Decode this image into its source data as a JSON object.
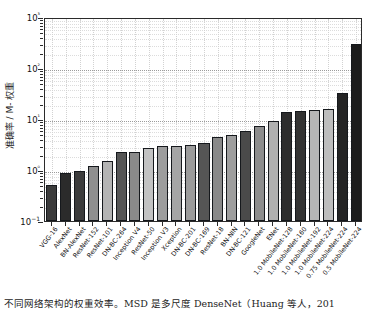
{
  "chart_data": {
    "type": "bar",
    "title": "",
    "xlabel": "",
    "ylabel": "准确率 / M- 权重",
    "yscale": "log",
    "ylim": [
      0.1,
      1000
    ],
    "ytick_labels": [
      "10−1",
      "10⁰",
      "10¹",
      "10²",
      "10³"
    ],
    "ytick_values": [
      0.1,
      1,
      10,
      100,
      1000
    ],
    "grid": true,
    "legend": "none",
    "categories": [
      "VGG-16",
      "AlexNet",
      "BN-AlexNet",
      "ResNet-152",
      "ResNet-101",
      "DN-BC-264",
      "Inception V4",
      "ResNet-50",
      "Inception V3",
      "Xception",
      "DN-BC-201",
      "DN-BC-169",
      "ResNet-18",
      "BN-NIN",
      "DN-BC-121",
      "GoogleNet",
      "ENet",
      "1.0 MobileNet-128",
      "1.0 MobileNet-160",
      "1.0 MobileNet-192",
      "1.0 MobileNet-224",
      "0.75 MobileNet-224",
      "0.5 MobileNet-224"
    ],
    "values": [
      0.5,
      0.88,
      0.95,
      1.2,
      1.5,
      2.3,
      2.3,
      2.7,
      2.9,
      3.0,
      3.1,
      3.4,
      4.4,
      4.8,
      5.8,
      7.2,
      9.2,
      13.5,
      14.5,
      14.8,
      15.5,
      33.0,
      300.0
    ],
    "bar_colors": [
      "#3b3b3b",
      "#2b2b2b",
      "#3b3b3b",
      "#8f8f8f",
      "#b4b4b4",
      "#555555",
      "#8a8a8a",
      "#c2c2c2",
      "#9d9d9d",
      "#a5a5a5",
      "#9b9b9b",
      "#555555",
      "#898989",
      "#9e9e9e",
      "#4a4a4a",
      "#8d8d8d",
      "#b0b0b0",
      "#2d2d2d",
      "#333333",
      "#b6b6b6",
      "#bdbdbd",
      "#242424",
      "#1c1c1c"
    ]
  },
  "caption": {
    "text": "不同网络架构的权重效率。MSD 是多尺度 DenseNet（Huang 等人，201"
  }
}
